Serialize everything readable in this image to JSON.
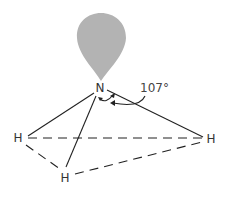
{
  "diagram": {
    "lone_pair": {
      "label": "lone pair",
      "color": "#b3b3b3"
    },
    "atoms": {
      "central": {
        "symbol": "N"
      },
      "h_left": {
        "symbol": "H"
      },
      "h_right": {
        "symbol": "H"
      },
      "h_bottom": {
        "symbol": "H"
      }
    },
    "bond_angle": {
      "label": "107°"
    },
    "colors": {
      "bond": "#222222",
      "text": "#333333"
    }
  }
}
